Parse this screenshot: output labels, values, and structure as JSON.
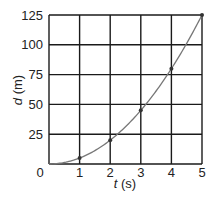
{
  "chart_data": {
    "type": "line",
    "title": "",
    "xlabel_var": "t",
    "xlabel_unit": "(s)",
    "ylabel_var": "d",
    "ylabel_unit": "(m)",
    "x": [
      0,
      1,
      2,
      3,
      4,
      5
    ],
    "series": [
      {
        "name": "d",
        "values": [
          0,
          5,
          20,
          45,
          80,
          125
        ]
      }
    ],
    "marked_points": [
      [
        1,
        5
      ],
      [
        2,
        20
      ],
      [
        3,
        45
      ],
      [
        4,
        80
      ],
      [
        5,
        125
      ]
    ],
    "xticks": [
      "0",
      "1",
      "2",
      "3",
      "4",
      "5"
    ],
    "yticks": [
      "25",
      "50",
      "75",
      "100",
      "125"
    ],
    "xlim": [
      0,
      5
    ],
    "ylim": [
      0,
      125
    ],
    "grid": true,
    "colors": {
      "grid": "#1a1a1a",
      "curve": "#777777",
      "point": "#333333"
    }
  }
}
